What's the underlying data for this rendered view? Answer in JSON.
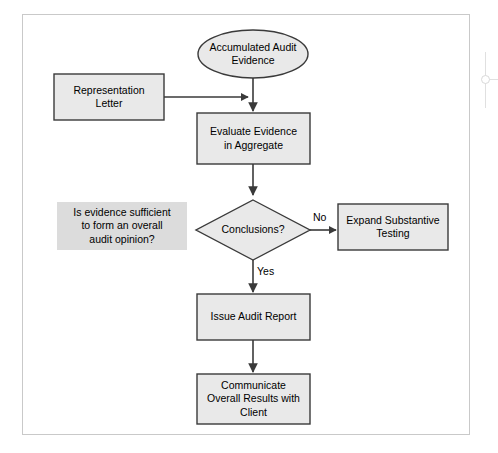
{
  "diagram": {
    "colors": {
      "node_fill": "#e9e9e9",
      "node_stroke": "#3a3a3a",
      "annotation_fill": "#dcdcdc",
      "frame_border": "#c9c9c9",
      "background": "#ffffff",
      "text": "#000000"
    },
    "nodes": [
      {
        "id": "accumulated-audit-evidence",
        "shape": "ellipse",
        "label": "Accumulated Audit\nEvidence"
      },
      {
        "id": "representation-letter",
        "shape": "rectangle",
        "label": "Representation\nLetter"
      },
      {
        "id": "evaluate-evidence-in-aggregate",
        "shape": "rectangle",
        "label": "Evaluate Evidence\nin Aggregate"
      },
      {
        "id": "conclusions-decision",
        "shape": "diamond",
        "label": "Conclusions?"
      },
      {
        "id": "expand-substantive-testing",
        "shape": "rectangle",
        "label": "Expand Substantive\nTesting"
      },
      {
        "id": "issue-audit-report",
        "shape": "rectangle",
        "label": "Issue Audit Report"
      },
      {
        "id": "communicate-overall-results",
        "shape": "rectangle",
        "label": "Communicate\nOverall Results with\nClient"
      }
    ],
    "annotation": {
      "id": "evidence-sufficiency-note",
      "label": "Is evidence sufficient\nto form an overall\naudit opinion?"
    },
    "edge_labels": {
      "no": "No",
      "yes": "Yes"
    }
  }
}
